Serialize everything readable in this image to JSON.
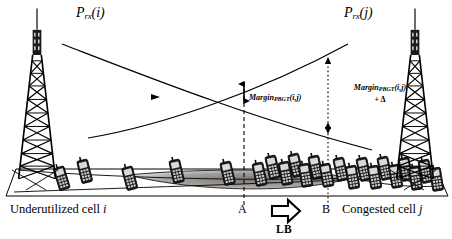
{
  "figure": {
    "width": 452,
    "height": 239,
    "background": "#ffffff",
    "ink": "#000000"
  },
  "curves": {
    "prx_i": {
      "label_main": "P",
      "label_sub": "rx",
      "label_arg": "(i)",
      "full": "P_rx(i)",
      "description": "received power from cell i, decreasing left to right"
    },
    "prx_j": {
      "label_main": "P",
      "label_sub": "rx",
      "label_arg": "(j)",
      "full": "P_rx(j)",
      "description": "received power from cell j, increasing left to right"
    }
  },
  "annotations": {
    "margin_a": {
      "main": "Margin",
      "sub": "PBGT",
      "arg": "(i,j)",
      "full": "Margin_PBGT(i,j)"
    },
    "margin_b": {
      "main": "Margin",
      "sub": "PBGT",
      "arg": "(i,j)",
      "line2": "+ Δ",
      "full": "Margin_PBGT(i,j) + Δ"
    }
  },
  "markers": {
    "point_a": "A",
    "point_b": "B",
    "lb": "LB"
  },
  "captions": {
    "left": {
      "text": "Underutilized cell",
      "cell": "i"
    },
    "right": {
      "text": "Congested cell",
      "cell": "j"
    }
  },
  "towers": {
    "left_name": "base-station-tower-cell-i",
    "right_name": "base-station-tower-cell-j"
  },
  "handsets": {
    "left_count": 6,
    "right_count": 16,
    "note": "mobile handsets distributed along the ground plane"
  }
}
